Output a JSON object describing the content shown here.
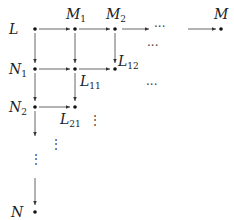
{
  "diagram": {
    "type": "grid-lattice",
    "nodes": {
      "L": {
        "label": "L",
        "sub": ""
      },
      "M1": {
        "label": "M",
        "sub": "1"
      },
      "M2": {
        "label": "M",
        "sub": "2"
      },
      "M": {
        "label": "M",
        "sub": ""
      },
      "N1": {
        "label": "N",
        "sub": "1"
      },
      "L11": {
        "label": "L",
        "sub": "11"
      },
      "L12": {
        "label": "L",
        "sub": "12"
      },
      "N2": {
        "label": "N",
        "sub": "2"
      },
      "L21": {
        "label": "L",
        "sub": "21"
      },
      "N": {
        "label": "N",
        "sub": ""
      }
    },
    "ellipsis_h": "···",
    "ellipsis_v": "⋮",
    "edges": [
      [
        "L",
        "M1"
      ],
      [
        "M1",
        "M2"
      ],
      [
        "M2",
        "..."
      ],
      [
        "...",
        "M"
      ],
      [
        "L",
        "N1"
      ],
      [
        "M1",
        "L11"
      ],
      [
        "M2",
        "L12"
      ],
      [
        "N1",
        "L11"
      ],
      [
        "L11",
        "L12"
      ],
      [
        "N1",
        "N2"
      ],
      [
        "L11",
        "L21"
      ],
      [
        "N2",
        "L21"
      ],
      [
        "N2",
        "..."
      ],
      [
        "...",
        "N"
      ]
    ],
    "colors": {
      "stroke": "#333333",
      "text": "#222222"
    }
  }
}
